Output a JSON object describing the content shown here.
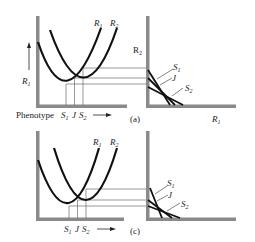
{
  "panels": [
    {
      "id": "a",
      "caption": "(a)",
      "left_plot": {
        "y_axis_label": "R",
        "y_axis_label_sub": "1",
        "x_axis_label": "Phenotype",
        "curve_labels": [
          {
            "name": "R",
            "sub": "1"
          },
          {
            "name": "R",
            "sub": "2"
          }
        ],
        "x_markers": [
          {
            "name": "S",
            "sub": "1"
          },
          {
            "name": "J",
            "sub": ""
          },
          {
            "name": "S",
            "sub": "2"
          }
        ],
        "x_arrow": "→"
      },
      "right_plot": {
        "y_axis_label": "R",
        "y_axis_label_sub": "2",
        "x_axis_label": "R",
        "x_axis_label_sub": "1",
        "line_labels": [
          {
            "name": "S",
            "sub": "1"
          },
          {
            "name": "J",
            "sub": ""
          },
          {
            "name": "S",
            "sub": "2"
          }
        ]
      }
    },
    {
      "id": "c",
      "caption": "(c)",
      "left_plot": {
        "curve_labels": [
          {
            "name": "R",
            "sub": "1"
          },
          {
            "name": "R",
            "sub": "2"
          }
        ],
        "x_markers": [
          {
            "name": "S",
            "sub": "1"
          },
          {
            "name": "J",
            "sub": ""
          },
          {
            "name": "S",
            "sub": "2"
          }
        ],
        "x_arrow": "→"
      },
      "right_plot": {
        "line_labels": [
          {
            "name": "S",
            "sub": "1"
          },
          {
            "name": "J",
            "sub": ""
          },
          {
            "name": "S",
            "sub": "2"
          }
        ]
      }
    }
  ],
  "colors": {
    "axis": "#8a8a8a",
    "curve": "#111111",
    "guide": "#555555",
    "text": "#222222"
  }
}
